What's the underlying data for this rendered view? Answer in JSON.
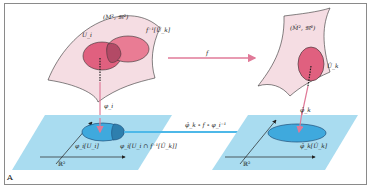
{
  "figure": {
    "panel_label": "A",
    "left_manifold": {
      "label": "(M², 𝔐²)",
      "chart_domain_label": "U_i",
      "preimage_label": "f⁻¹[Û_k]"
    },
    "right_manifold": {
      "label": "(M̂², 𝔐̂²)",
      "chart_domain_label": "Û_k"
    },
    "map_f_label": "f",
    "left_chart_map_label": "φ_i",
    "right_chart_map_label": "φ̂_k",
    "transition_label": "φ̂_k ∘ f ∘ φ_i⁻¹",
    "left_plane": {
      "label": "ℝ²",
      "image_label": "φ_i[U_i]",
      "intersection_label": "φ_i[U_i ∩ f⁻¹[Û_k]]"
    },
    "right_plane": {
      "label": "ℝ²",
      "image_label": "φ̂_k[Û_k]"
    },
    "colors": {
      "manifold_fill": "#f5dde3",
      "chart_fill": "#e0607f",
      "overlap_fill": "#b34a66",
      "arrow_pink": "#e07a98",
      "plane_fill": "#a9dcf0",
      "plane_ellipse": "#3fa9dd",
      "transition_arrow": "#4db8e8"
    }
  }
}
